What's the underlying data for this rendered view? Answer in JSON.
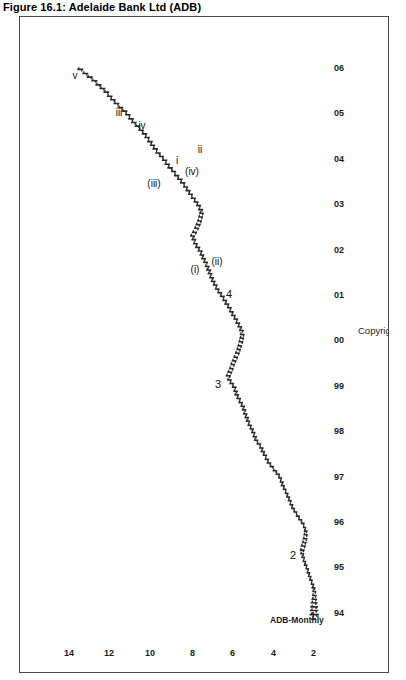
{
  "figure": {
    "title": "Figure 16.1: Adelaide Bank Ltd (ADB)",
    "series_label": "ADB-Monthly",
    "copyright": "Copyright 2005  THE CHARTIST   www.reefcap.com"
  },
  "chart_data": {
    "type": "line",
    "title": "Figure 16.1: Adelaide Bank Ltd (ADB)",
    "subtitle": "ADB-Monthly",
    "xlabel": "",
    "ylabel": "",
    "grid": false,
    "legend": "none",
    "orientation": "rotated-90",
    "xlim": [
      1993.6,
      2006.2
    ],
    "ylim": [
      0.8,
      15.0
    ],
    "yticks": [
      14,
      12,
      10,
      8,
      6,
      4,
      2
    ],
    "ytick_labels": [
      "14",
      "12",
      "10",
      "8",
      "6",
      "4",
      "2"
    ],
    "xticks": [
      1994,
      1995,
      1996,
      1997,
      1998,
      1999,
      2000,
      2001,
      2002,
      2003,
      2004,
      2005,
      2006
    ],
    "xtick_labels": [
      "94",
      "95",
      "96",
      "97",
      "98",
      "99",
      "00",
      "01",
      "02",
      "03",
      "04",
      "05",
      "06"
    ],
    "series": [
      {
        "name": "ADB monthly OHLC",
        "x": [
          1993.95,
          1994.04,
          1994.12,
          1994.21,
          1994.29,
          1994.37,
          1994.46,
          1994.54,
          1994.62,
          1994.71,
          1994.79,
          1994.87,
          1994.96,
          1995.04,
          1995.12,
          1995.21,
          1995.29,
          1995.37,
          1995.46,
          1995.54,
          1995.62,
          1995.71,
          1995.79,
          1995.87,
          1995.96,
          1996.04,
          1996.12,
          1996.21,
          1996.29,
          1996.37,
          1996.46,
          1996.54,
          1996.62,
          1996.71,
          1996.79,
          1996.87,
          1996.96,
          1997.04,
          1997.12,
          1997.21,
          1997.29,
          1997.37,
          1997.46,
          1997.54,
          1997.62,
          1997.71,
          1997.79,
          1997.87,
          1997.96,
          1998.04,
          1998.12,
          1998.21,
          1998.29,
          1998.37,
          1998.46,
          1998.54,
          1998.62,
          1998.71,
          1998.79,
          1998.87,
          1998.96,
          1999.04,
          1999.12,
          1999.21,
          1999.29,
          1999.37,
          1999.46,
          1999.54,
          1999.62,
          1999.71,
          1999.79,
          1999.87,
          1999.96,
          2000.04,
          2000.12,
          2000.21,
          2000.29,
          2000.37,
          2000.46,
          2000.54,
          2000.62,
          2000.71,
          2000.79,
          2000.87,
          2000.96,
          2001.04,
          2001.12,
          2001.21,
          2001.29,
          2001.37,
          2001.46,
          2001.54,
          2001.62,
          2001.71,
          2001.79,
          2001.87,
          2001.96,
          2002.04,
          2002.12,
          2002.21,
          2002.29,
          2002.37,
          2002.46,
          2002.54,
          2002.62,
          2002.71,
          2002.79,
          2002.87,
          2002.96,
          2003.04,
          2003.12,
          2003.21,
          2003.29,
          2003.37,
          2003.46,
          2003.54,
          2003.62,
          2003.71,
          2003.79,
          2003.87,
          2003.96,
          2004.04,
          2004.12,
          2004.21,
          2004.29,
          2004.37,
          2004.46,
          2004.54,
          2004.62,
          2004.71,
          2004.79,
          2004.87,
          2004.96,
          2005.04,
          2005.12,
          2005.21,
          2005.29,
          2005.37,
          2005.46,
          2005.54,
          2005.62,
          2005.71,
          2005.79,
          2005.87,
          2005.96
        ],
        "high": [
          1.72,
          1.7,
          1.68,
          1.66,
          1.62,
          1.6,
          1.58,
          1.62,
          1.66,
          1.74,
          1.8,
          1.86,
          1.92,
          2.0,
          2.06,
          2.12,
          2.18,
          2.2,
          2.16,
          2.1,
          2.06,
          2.02,
          2.0,
          2.05,
          2.15,
          2.28,
          2.4,
          2.52,
          2.64,
          2.72,
          2.8,
          2.88,
          2.95,
          3.05,
          3.15,
          3.2,
          3.28,
          3.4,
          3.55,
          3.7,
          3.85,
          3.95,
          4.05,
          4.15,
          4.22,
          4.35,
          4.48,
          4.55,
          4.62,
          4.7,
          4.8,
          4.88,
          4.95,
          5.02,
          5.08,
          5.15,
          5.25,
          5.35,
          5.45,
          5.5,
          5.58,
          5.7,
          5.82,
          5.88,
          5.8,
          5.72,
          5.65,
          5.58,
          5.5,
          5.42,
          5.35,
          5.3,
          5.25,
          5.2,
          5.18,
          5.22,
          5.3,
          5.4,
          5.5,
          5.62,
          5.72,
          5.82,
          5.95,
          6.05,
          6.18,
          6.3,
          6.42,
          6.52,
          6.62,
          6.7,
          6.78,
          6.85,
          6.92,
          7.0,
          7.1,
          7.18,
          7.28,
          7.4,
          7.5,
          7.58,
          7.65,
          7.55,
          7.45,
          7.38,
          7.3,
          7.25,
          7.2,
          7.25,
          7.35,
          7.48,
          7.62,
          7.75,
          7.88,
          8.0,
          8.15,
          8.3,
          8.45,
          8.6,
          8.78,
          8.92,
          9.05,
          9.2,
          9.38,
          9.52,
          9.65,
          9.78,
          9.92,
          10.05,
          10.22,
          10.4,
          10.58,
          10.72,
          10.88,
          11.05,
          11.25,
          11.45,
          11.62,
          11.78,
          11.95,
          12.15,
          12.35,
          12.55,
          12.78,
          13.0,
          13.25
        ],
        "low": [
          1.25,
          1.28,
          1.3,
          1.32,
          1.34,
          1.36,
          1.38,
          1.42,
          1.48,
          1.56,
          1.62,
          1.68,
          1.74,
          1.82,
          1.88,
          1.94,
          1.98,
          1.96,
          1.9,
          1.86,
          1.82,
          1.8,
          1.82,
          1.88,
          1.96,
          2.08,
          2.2,
          2.32,
          2.44,
          2.52,
          2.6,
          2.68,
          2.76,
          2.86,
          2.94,
          3.0,
          3.08,
          3.18,
          3.32,
          3.48,
          3.62,
          3.72,
          3.82,
          3.92,
          4.0,
          4.12,
          4.25,
          4.32,
          4.4,
          4.48,
          4.58,
          4.66,
          4.72,
          4.8,
          4.86,
          4.92,
          5.02,
          5.12,
          5.22,
          5.28,
          5.34,
          5.46,
          5.58,
          5.62,
          5.55,
          5.48,
          5.42,
          5.34,
          5.26,
          5.18,
          5.12,
          5.06,
          5.0,
          4.96,
          4.94,
          4.98,
          5.06,
          5.16,
          5.26,
          5.38,
          5.48,
          5.58,
          5.7,
          5.8,
          5.92,
          6.05,
          6.18,
          6.28,
          6.38,
          6.46,
          6.54,
          6.6,
          6.68,
          6.76,
          6.86,
          6.94,
          7.02,
          7.14,
          7.26,
          7.34,
          7.4,
          7.3,
          7.2,
          7.12,
          7.05,
          7.0,
          6.96,
          7.0,
          7.1,
          7.22,
          7.36,
          7.5,
          7.62,
          7.74,
          7.88,
          8.02,
          8.18,
          8.34,
          8.5,
          8.64,
          8.78,
          8.94,
          9.1,
          9.24,
          9.38,
          9.5,
          9.64,
          9.78,
          9.94,
          10.12,
          10.3,
          10.44,
          10.6,
          10.76,
          10.96,
          11.16,
          11.34,
          11.5,
          11.66,
          11.85,
          12.05,
          12.25,
          12.48,
          12.7,
          12.95
        ]
      }
    ],
    "annotations": [
      {
        "label": "1",
        "x": 1993.92,
        "y": 1.55,
        "kind": "wave-degree-primary"
      },
      {
        "label": "2",
        "x": 1995.28,
        "y": 2.52,
        "kind": "wave-degree-primary"
      },
      {
        "label": "3",
        "x": 1999.05,
        "y": 6.25,
        "kind": "wave-degree-primary"
      },
      {
        "label": "4",
        "x": 2001.02,
        "y": 5.72,
        "kind": "wave-degree-primary"
      },
      {
        "label": "(i)",
        "x": 2001.55,
        "y": 7.38,
        "kind": "wave-degree-intermediate"
      },
      {
        "label": "(ii)",
        "x": 2001.72,
        "y": 6.3,
        "kind": "wave-degree-intermediate"
      },
      {
        "label": "(iii)",
        "x": 2003.45,
        "y": 9.45,
        "kind": "wave-degree-intermediate"
      },
      {
        "label": "(iv)",
        "x": 2003.72,
        "y": 7.55,
        "kind": "wave-degree-intermediate"
      },
      {
        "label": "i",
        "x": 2003.95,
        "y": 8.3,
        "kind": "wave-degree-minor"
      },
      {
        "label": "ii",
        "x": 2004.2,
        "y": 7.15,
        "kind": "wave-degree-minor"
      },
      {
        "label": "iii",
        "x": 2005.0,
        "y": 11.2,
        "kind": "wave-degree-minor"
      },
      {
        "label": "iv",
        "x": 2004.72,
        "y": 10.05,
        "kind": "wave-degree-minor"
      },
      {
        "label": "v",
        "x": 2005.82,
        "y": 13.35,
        "kind": "wave-degree-minor"
      }
    ]
  }
}
